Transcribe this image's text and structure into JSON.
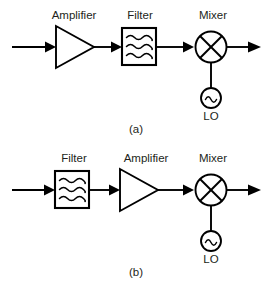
{
  "figure": {
    "background_color": "#ffffff",
    "line_color": "#000000",
    "text_color": "#231f20"
  },
  "panels": [
    {
      "caption": "(a)",
      "labels": {
        "stage1": "Amplifier",
        "stage2": "Filter",
        "stage3": "Mixer",
        "lo": "LO"
      },
      "chain": [
        "input-arrow",
        "amplifier",
        "filter",
        "mixer",
        "output-arrow"
      ],
      "lo_connects_to": "mixer"
    },
    {
      "caption": "(b)",
      "labels": {
        "stage1": "Filter",
        "stage2": "Amplifier",
        "stage3": "Mixer",
        "lo": "LO"
      },
      "chain": [
        "input-arrow",
        "filter",
        "amplifier",
        "mixer",
        "output-arrow"
      ],
      "lo_connects_to": "mixer"
    }
  ],
  "icons": {
    "amplifier": "triangle-amplifier-icon",
    "filter": "filter-box-icon",
    "mixer": "mixer-circle-x-icon",
    "oscillator": "oscillator-sine-circle-icon",
    "arrow": "arrow-right-icon"
  }
}
